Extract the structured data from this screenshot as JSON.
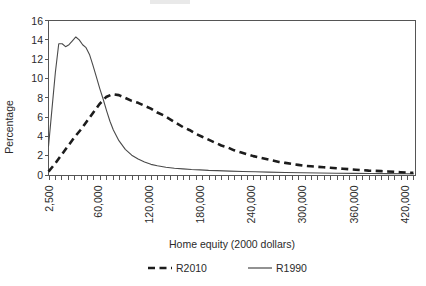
{
  "chart_data": {
    "type": "line",
    "title": "",
    "xlabel": "Home equity (2000 dollars)",
    "ylabel": "Percentage",
    "ylim": [
      0,
      16
    ],
    "yticks": [
      0,
      2,
      4,
      6,
      8,
      10,
      12,
      14,
      16
    ],
    "xlim": [
      2500,
      432500
    ],
    "xticks": [
      2500,
      60000,
      120000,
      180000,
      240000,
      300000,
      360000,
      420000
    ],
    "xticklabels": [
      "2,500",
      "60,000",
      "120,000",
      "180,000",
      "240,000",
      "300,000",
      "360,000",
      "420,000"
    ],
    "xtick_minor_step": 7500,
    "grid": false,
    "legend_position": "below",
    "series": [
      {
        "name": "R2010",
        "style": "dashed",
        "color": "#1c1c1c",
        "x": [
          2500,
          10000,
          17500,
          25000,
          32500,
          40000,
          47500,
          55000,
          62500,
          70000,
          77500,
          85000,
          92500,
          100000,
          107500,
          115000,
          122500,
          130000,
          137500,
          145000,
          152500,
          160000,
          167500,
          175000,
          182500,
          190000,
          197500,
          205000,
          212500,
          220000,
          227500,
          235000,
          242500,
          250000,
          257500,
          265000,
          272500,
          280000,
          287500,
          295000,
          302500,
          310000,
          317500,
          325000,
          332500,
          340000,
          347500,
          355000,
          362500,
          370000,
          377500,
          385000,
          392500,
          400000,
          407500,
          415000,
          422500,
          430000
        ],
        "values": [
          0.4,
          1.2,
          2.1,
          3.0,
          3.9,
          4.7,
          5.6,
          6.5,
          7.4,
          8.1,
          8.4,
          8.3,
          8.0,
          7.7,
          7.5,
          7.2,
          6.9,
          6.5,
          6.2,
          5.8,
          5.4,
          5.0,
          4.7,
          4.3,
          4.0,
          3.7,
          3.4,
          3.1,
          2.9,
          2.6,
          2.4,
          2.2,
          2.0,
          1.85,
          1.7,
          1.55,
          1.4,
          1.3,
          1.2,
          1.1,
          1.0,
          0.95,
          0.9,
          0.85,
          0.8,
          0.75,
          0.7,
          0.65,
          0.6,
          0.55,
          0.5,
          0.48,
          0.45,
          0.42,
          0.38,
          0.34,
          0.3,
          0.28
        ]
      },
      {
        "name": "R1990",
        "style": "solid",
        "color": "#4a4a4a",
        "x": [
          2500,
          6500,
          10500,
          14500,
          18500,
          22500,
          26500,
          30500,
          34500,
          38500,
          42500,
          46500,
          50500,
          54500,
          58500,
          62500,
          66500,
          70500,
          74500,
          78500,
          85000,
          92500,
          100000,
          107500,
          115000,
          122500,
          130000,
          140000,
          150000,
          160000,
          170000,
          180000,
          190000,
          200000,
          215000,
          230000,
          245000,
          260000,
          280000,
          300000,
          320000,
          340000,
          360000,
          380000,
          400000,
          420000,
          430000
        ],
        "values": [
          3.0,
          6.8,
          10.6,
          13.6,
          13.6,
          13.3,
          13.5,
          13.9,
          14.3,
          14.0,
          13.5,
          13.2,
          12.5,
          11.4,
          10.2,
          9.0,
          7.9,
          6.7,
          5.6,
          4.7,
          3.6,
          2.7,
          2.1,
          1.7,
          1.4,
          1.15,
          1.0,
          0.85,
          0.75,
          0.68,
          0.62,
          0.58,
          0.53,
          0.5,
          0.45,
          0.42,
          0.38,
          0.35,
          0.31,
          0.28,
          0.26,
          0.24,
          0.22,
          0.2,
          0.19,
          0.18,
          0.17
        ]
      }
    ]
  },
  "legend": {
    "items": [
      {
        "label": "R2010"
      },
      {
        "label": "R1990"
      }
    ]
  }
}
